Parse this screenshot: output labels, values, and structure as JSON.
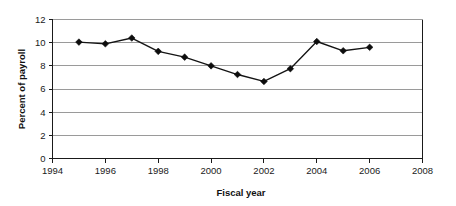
{
  "chart_data": {
    "type": "line",
    "title": "",
    "xlabel": "Fiscal year",
    "ylabel": "Percent of payroll",
    "xlim": [
      1994,
      2008
    ],
    "ylim": [
      0,
      12
    ],
    "xticks": [
      1994,
      1996,
      1998,
      2000,
      2002,
      2004,
      2006,
      2008
    ],
    "xtick_labels": [
      "1994",
      "1996",
      "1998",
      "2000",
      "2002",
      "2004",
      "2006",
      "2008"
    ],
    "yticks": [
      0,
      2,
      4,
      6,
      8,
      10,
      12
    ],
    "ytick_labels": [
      "0",
      "2",
      "4",
      "6",
      "8",
      "10",
      "12"
    ],
    "grid": "horizontal",
    "legend": "none",
    "marker": "diamond",
    "line_color": "#141414",
    "marker_color": "#0d0d0d",
    "grid_color": "#9a9a9a",
    "axis_color": "#1a1a1a",
    "background_color": "#ffffff",
    "x": [
      1995,
      1996,
      1997,
      1998,
      1999,
      2000,
      2001,
      2002,
      2003,
      2004,
      2005,
      2006
    ],
    "values": [
      10.05,
      9.9,
      10.4,
      9.25,
      8.75,
      8.0,
      7.25,
      6.65,
      7.75,
      10.1,
      9.3,
      9.6
    ],
    "series": [
      {
        "name": "Percent of payroll",
        "values": [
          10.05,
          9.9,
          10.4,
          9.25,
          8.75,
          8.0,
          7.25,
          6.65,
          7.75,
          10.1,
          9.3,
          9.6
        ]
      }
    ]
  }
}
